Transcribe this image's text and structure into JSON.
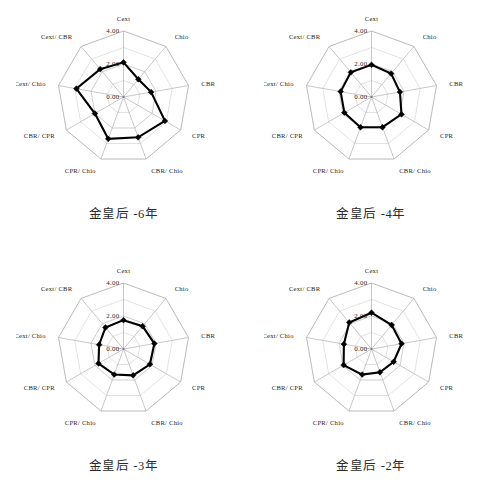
{
  "figure": {
    "axis_labels": [
      "Cext",
      "Chio",
      "CBR",
      "CPR",
      "CBR/ Chio",
      "CPR/ Chio",
      "CBR/ CPR",
      "Cext/ Chio",
      "Cext/ CBR"
    ],
    "scale_labels": [
      "0.00",
      "2.00",
      "4.00"
    ],
    "series_color": "#000000",
    "grid_color": "#b9b9b9"
  },
  "chart_data": [
    {
      "type": "radar",
      "title": "金皇后 -6年",
      "categories": [
        "Cext",
        "Chio",
        "CBR",
        "CPR",
        "CBR/ Chio",
        "CPR/ Chio",
        "CBR/ CPR",
        "Cext/ Chio",
        "Cext/ CBR"
      ],
      "values": [
        2.1,
        1.4,
        1.7,
        2.9,
        2.6,
        2.7,
        2.0,
        2.9,
        2.2
      ],
      "rlim": [
        0,
        4
      ],
      "rticks": [
        0.0,
        2.0,
        4.0
      ],
      "rtick_labels": [
        "0.00",
        "2.00",
        "4.00"
      ],
      "grid": true,
      "legend": "none"
    },
    {
      "type": "radar",
      "title": "金皇后 -4年",
      "categories": [
        "Cext",
        "Chio",
        "CBR",
        "CPR",
        "CBR/ Chio",
        "CPR/ Chio",
        "CBR/ CPR",
        "Cext/ Chio",
        "Cext/ CBR"
      ],
      "values": [
        1.95,
        1.85,
        1.75,
        2.1,
        1.95,
        1.95,
        1.9,
        1.9,
        1.95
      ],
      "rlim": [
        0,
        4
      ],
      "rticks": [
        0.0,
        2.0,
        4.0
      ],
      "rtick_labels": [
        "0.00",
        "2.00",
        "4.00"
      ],
      "grid": true,
      "legend": "none"
    },
    {
      "type": "radar",
      "title": "金皇后 -3年",
      "categories": [
        "Cext",
        "Chio",
        "CBR",
        "CPR",
        "CBR/ Chio",
        "CPR/ Chio",
        "CBR/ CPR",
        "Cext/ Chio",
        "Cext/ CBR"
      ],
      "values": [
        1.75,
        1.8,
        1.9,
        1.85,
        1.7,
        1.65,
        1.75,
        1.5,
        1.7
      ],
      "rlim": [
        0,
        4
      ],
      "rticks": [
        0.0,
        2.0,
        4.0
      ],
      "rtick_labels": [
        "0.00",
        "2.00",
        "4.00"
      ],
      "grid": true,
      "legend": "none"
    },
    {
      "type": "radar",
      "title": "金皇后 -2年",
      "categories": [
        "Cext",
        "Chio",
        "CBR",
        "CPR",
        "CBR/ Chio",
        "CPR/ Chio",
        "CBR/ CPR",
        "Cext/ Chio",
        "Cext/ CBR"
      ],
      "values": [
        2.2,
        1.9,
        1.85,
        1.55,
        1.5,
        1.65,
        1.95,
        1.7,
        2.1
      ],
      "rlim": [
        0,
        4
      ],
      "rticks": [
        0.0,
        2.0,
        4.0
      ],
      "rtick_labels": [
        "0.00",
        "2.00",
        "4.00"
      ],
      "grid": true,
      "legend": "none"
    }
  ]
}
